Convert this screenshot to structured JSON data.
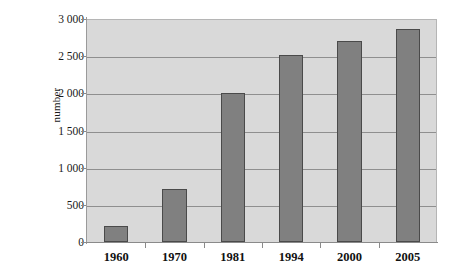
{
  "chart_data": {
    "type": "bar",
    "title": "",
    "subtitle": "",
    "xlabel": "",
    "ylabel": "number",
    "categories": [
      "1960",
      "1970",
      "1981",
      "1994",
      "2000",
      "2005"
    ],
    "values": [
      220,
      710,
      2000,
      2510,
      2710,
      2860
    ],
    "series": [
      {
        "name": "number",
        "values": [
          220,
          710,
          2000,
          2510,
          2710,
          2860
        ]
      }
    ],
    "ylim": [
      0,
      3000
    ],
    "ytick_values": [
      0,
      500,
      1000,
      1500,
      2000,
      2500,
      3000
    ],
    "ytick_labels": [
      "0",
      "500",
      "1 000",
      "1 500",
      "2 000",
      "2 500",
      "3 000"
    ],
    "grid": "horizontal",
    "legend": "none",
    "annotations": [],
    "colors": {
      "bar_fill": "#808080",
      "bar_border": "#4a4a4a",
      "plot_background": "#d9d9d9",
      "gridline": "#8f8f8f",
      "axis_line": "#8a8a8a",
      "text": "#111111",
      "page_background": "#ffffff"
    }
  }
}
